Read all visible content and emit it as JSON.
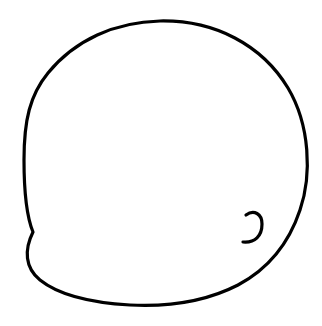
{
  "drawing": {
    "background": "#ffffff",
    "stroke_color": "#000000",
    "shapes": [
      {
        "name": "outline",
        "kind": "closed-blob"
      },
      {
        "name": "hook",
        "kind": "small-curl"
      }
    ]
  }
}
